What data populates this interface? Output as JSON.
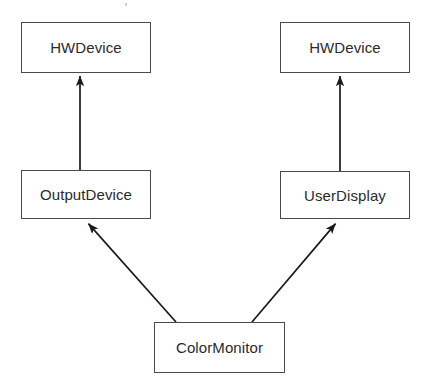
{
  "diagram": {
    "type": "uml-class-diagram",
    "canvas": {
      "width": 428,
      "height": 387,
      "background": "#ffffff"
    },
    "style": {
      "box_border_color": "#4a4a4a",
      "box_fill_color": "#ffffff",
      "text_color": "#2b2b2b",
      "edge_color": "#1a1a1a",
      "arrowhead": "solid-filled-triangle"
    },
    "nodes": [
      {
        "id": "hwdevice-left",
        "label": "HWDevice",
        "x": 21,
        "y": 22,
        "width": 130,
        "height": 51
      },
      {
        "id": "hwdevice-right",
        "label": "HWDevice",
        "x": 280,
        "y": 22,
        "width": 130,
        "height": 51
      },
      {
        "id": "outputdevice",
        "label": "OutputDevice",
        "x": 21,
        "y": 170,
        "width": 130,
        "height": 49
      },
      {
        "id": "userdisplay",
        "label": "UserDisplay",
        "x": 280,
        "y": 171,
        "width": 130,
        "height": 48
      },
      {
        "id": "colormonitor",
        "label": "ColorMonitor",
        "x": 154,
        "y": 322,
        "width": 131,
        "height": 51
      }
    ],
    "edges": [
      {
        "id": "edge-outputdevice-to-hwdevice",
        "from": "outputdevice",
        "to": "hwdevice-left",
        "relation": "generalization",
        "from_point": [
          80,
          170
        ],
        "to_point": [
          80,
          74
        ]
      },
      {
        "id": "edge-userdisplay-to-hwdevice",
        "from": "userdisplay",
        "to": "hwdevice-right",
        "relation": "generalization",
        "from_point": [
          340,
          171
        ],
        "to_point": [
          340,
          74
        ]
      },
      {
        "id": "edge-colormonitor-to-outputdevice",
        "from": "colormonitor",
        "to": "outputdevice",
        "relation": "generalization",
        "from_point": [
          176,
          322
        ],
        "to_point": [
          86,
          221
        ]
      },
      {
        "id": "edge-colormonitor-to-userdisplay",
        "from": "colormonitor",
        "to": "userdisplay",
        "relation": "generalization",
        "from_point": [
          252,
          322
        ],
        "to_point": [
          338,
          221
        ]
      }
    ]
  }
}
